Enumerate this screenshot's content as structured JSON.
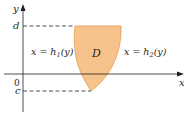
{
  "diagram": {
    "axes": {
      "x_label": "x",
      "y_label": "y",
      "origin_label": "0"
    },
    "levels": {
      "top_label": "d",
      "bottom_label": "c"
    },
    "region": {
      "label": "D",
      "fill_color": "#f7c38c",
      "stroke_color": "#e49a4c"
    },
    "curves": {
      "left_label_prefix": "x = h",
      "left_subscript": "1",
      "left_suffix": "(y)",
      "right_label_prefix": "x = h",
      "right_subscript": "2",
      "right_suffix": "(y)"
    },
    "colors": {
      "axis": "#231f20",
      "dashed_guides": "#231f20"
    }
  }
}
